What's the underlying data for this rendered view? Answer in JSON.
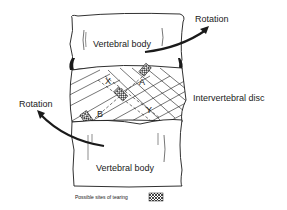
{
  "diagram": {
    "labels": {
      "rotation_top": "Rotation",
      "rotation_left": "Rotation",
      "vertebral_body_top": "Vertebral body",
      "vertebral_body_bottom": "Vertebral body",
      "intervertebral_disc": "Intervertebral disc",
      "point_x": "X",
      "point_a": "A",
      "point_y": "Y",
      "point_b": "B"
    },
    "legend": {
      "text": "Possible sites of tearing",
      "swatch_icon": "crosshatch-swatch-icon"
    },
    "colors": {
      "line": "#1a1a1a",
      "background": "#ffffff"
    }
  }
}
